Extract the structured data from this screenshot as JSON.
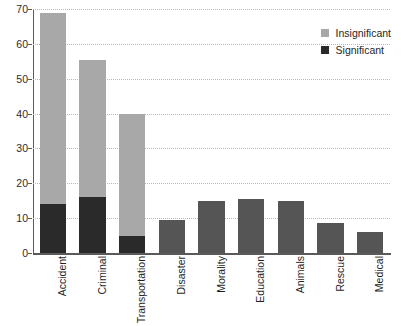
{
  "chart_data": {
    "type": "bar",
    "title": "",
    "subtitle": "",
    "xlabel": "",
    "ylabel": "",
    "stacked": true,
    "grid": true,
    "legend_position": "top-right",
    "ylim": [
      0,
      70
    ],
    "yticks": [
      0,
      10,
      20,
      30,
      40,
      50,
      60,
      70
    ],
    "ytick_labels": [
      "0",
      "10",
      "20",
      "30",
      "40",
      "50",
      "60",
      "70"
    ],
    "categories": [
      "Accident",
      "Criminal",
      "Transportation",
      "Disaster",
      "Morality",
      "Education",
      "Animals",
      "Rescue",
      "Medical"
    ],
    "series": [
      {
        "name": "Significant",
        "color": "#2a2a2a",
        "values": [
          14,
          16,
          5,
          0,
          0,
          0,
          0,
          0,
          0
        ]
      },
      {
        "name": "Insignificant",
        "color": "#a8a8a8",
        "values": [
          55,
          39.5,
          35,
          0,
          0,
          0,
          0,
          0,
          0
        ]
      },
      {
        "name": "Total",
        "color": "#555555",
        "values": [
          0,
          0,
          0,
          9.5,
          15,
          15.5,
          14.8,
          8.5,
          6
        ]
      }
    ],
    "totals": [
      69,
      55.5,
      40,
      9.5,
      15,
      15.5,
      14.8,
      8.5,
      6
    ]
  },
  "legend": {
    "items": [
      {
        "label": "Insignificant",
        "color": "#a8a8a8"
      },
      {
        "label": "Significant",
        "color": "#2a2a2a"
      }
    ]
  }
}
